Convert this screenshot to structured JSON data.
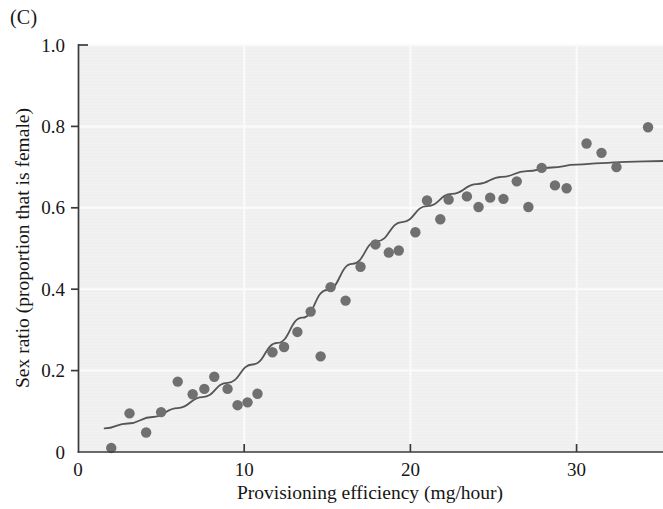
{
  "figure": {
    "panel_label": "(C)",
    "background_color": "#ffffff",
    "plot_background_color": "#f1f1f1",
    "gridline_color": "#fbfbfb",
    "axis_color": "#3a3a3a"
  },
  "chart_data": {
    "type": "scatter",
    "title": "",
    "subtitle": "",
    "xlabel": "Provisioning efficiency (mg/hour)",
    "ylabel": "Sex ratio (proportion that is female)",
    "xlim": [
      0,
      35.2
    ],
    "ylim": [
      0,
      1.0
    ],
    "xticks": [
      0,
      10,
      20,
      30
    ],
    "xtick_labels": [
      "0",
      "10",
      "20",
      "30"
    ],
    "yticks": [
      0,
      0.2,
      0.4,
      0.6,
      0.8,
      1.0
    ],
    "ytick_labels": [
      "0",
      "0.2",
      "0.4",
      "0.6",
      "0.8",
      "1.0"
    ],
    "grid": true,
    "legend": null,
    "legend_position": "none",
    "point_color": "#707070",
    "point_radius": 5.2,
    "line_color": "#555555",
    "line_width": 1.8,
    "series": [
      {
        "name": "Observed sex ratio",
        "type": "scatter",
        "points": [
          {
            "x": 2.0,
            "y": 0.01
          },
          {
            "x": 3.1,
            "y": 0.095
          },
          {
            "x": 4.1,
            "y": 0.048
          },
          {
            "x": 5.0,
            "y": 0.098
          },
          {
            "x": 6.0,
            "y": 0.173
          },
          {
            "x": 6.9,
            "y": 0.142
          },
          {
            "x": 7.6,
            "y": 0.155
          },
          {
            "x": 8.2,
            "y": 0.185
          },
          {
            "x": 9.0,
            "y": 0.155
          },
          {
            "x": 9.6,
            "y": 0.115
          },
          {
            "x": 10.2,
            "y": 0.122
          },
          {
            "x": 10.8,
            "y": 0.143
          },
          {
            "x": 11.7,
            "y": 0.245
          },
          {
            "x": 12.4,
            "y": 0.258
          },
          {
            "x": 13.2,
            "y": 0.295
          },
          {
            "x": 14.0,
            "y": 0.345
          },
          {
            "x": 14.6,
            "y": 0.235
          },
          {
            "x": 15.2,
            "y": 0.405
          },
          {
            "x": 16.1,
            "y": 0.372
          },
          {
            "x": 17.0,
            "y": 0.455
          },
          {
            "x": 17.9,
            "y": 0.51
          },
          {
            "x": 18.7,
            "y": 0.49
          },
          {
            "x": 19.3,
            "y": 0.495
          },
          {
            "x": 20.3,
            "y": 0.54
          },
          {
            "x": 21.0,
            "y": 0.618
          },
          {
            "x": 21.8,
            "y": 0.572
          },
          {
            "x": 22.3,
            "y": 0.62
          },
          {
            "x": 23.4,
            "y": 0.628
          },
          {
            "x": 24.1,
            "y": 0.602
          },
          {
            "x": 24.8,
            "y": 0.625
          },
          {
            "x": 25.6,
            "y": 0.622
          },
          {
            "x": 26.4,
            "y": 0.665
          },
          {
            "x": 27.1,
            "y": 0.602
          },
          {
            "x": 27.9,
            "y": 0.698
          },
          {
            "x": 28.7,
            "y": 0.655
          },
          {
            "x": 29.4,
            "y": 0.648
          },
          {
            "x": 30.6,
            "y": 0.758
          },
          {
            "x": 31.5,
            "y": 0.735
          },
          {
            "x": 32.4,
            "y": 0.7
          },
          {
            "x": 34.3,
            "y": 0.798
          }
        ]
      },
      {
        "name": "Fitted logistic curve",
        "type": "line",
        "points": [
          {
            "x": 1.6,
            "y": 0.058
          },
          {
            "x": 3.0,
            "y": 0.07
          },
          {
            "x": 4.5,
            "y": 0.086
          },
          {
            "x": 6.0,
            "y": 0.108
          },
          {
            "x": 7.5,
            "y": 0.135
          },
          {
            "x": 9.0,
            "y": 0.17
          },
          {
            "x": 10.5,
            "y": 0.215
          },
          {
            "x": 12.0,
            "y": 0.268
          },
          {
            "x": 13.5,
            "y": 0.33
          },
          {
            "x": 15.0,
            "y": 0.398
          },
          {
            "x": 16.5,
            "y": 0.462
          },
          {
            "x": 18.0,
            "y": 0.518
          },
          {
            "x": 19.5,
            "y": 0.565
          },
          {
            "x": 21.0,
            "y": 0.604
          },
          {
            "x": 22.5,
            "y": 0.634
          },
          {
            "x": 24.0,
            "y": 0.658
          },
          {
            "x": 25.5,
            "y": 0.676
          },
          {
            "x": 27.0,
            "y": 0.69
          },
          {
            "x": 28.5,
            "y": 0.699
          },
          {
            "x": 30.0,
            "y": 0.706
          },
          {
            "x": 31.5,
            "y": 0.71
          },
          {
            "x": 33.0,
            "y": 0.713
          },
          {
            "x": 35.2,
            "y": 0.715
          }
        ]
      }
    ]
  }
}
